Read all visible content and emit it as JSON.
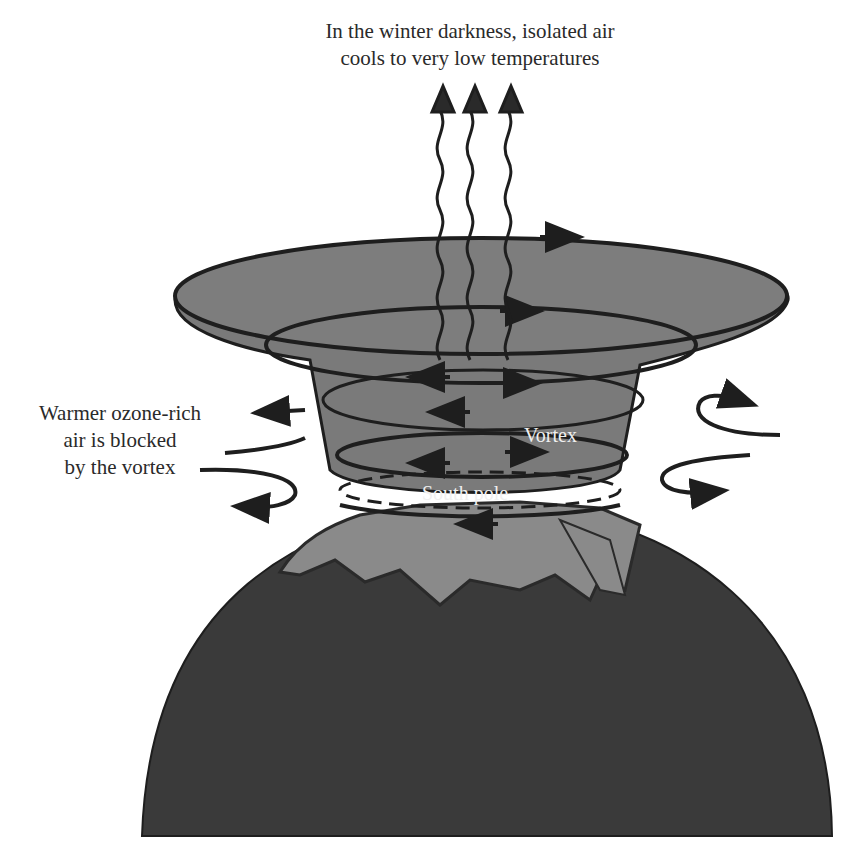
{
  "diagram": {
    "title_line1": "In the winter darkness, isolated air",
    "title_line2": "cools to very low temperatures",
    "left_label_line1": "Warmer ozone-rich",
    "left_label_line2": "air is blocked",
    "left_label_line3": "by the vortex",
    "vortex_label": "Vortex",
    "pole_label": "South pole"
  },
  "colors": {
    "background": "#ffffff",
    "vortex_fill": "#7a7a7a",
    "earth_fill": "#3a3a3a",
    "ice_fill": "#8a8a8a",
    "stroke": "#1e1e1e",
    "text": "#2a2a2a",
    "inner_text": "#f0f0f0"
  }
}
